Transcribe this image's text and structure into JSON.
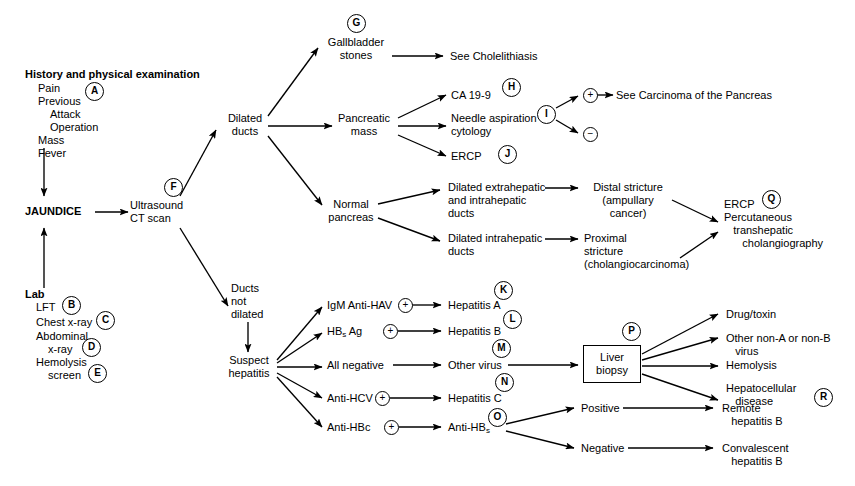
{
  "diagram": {
    "type": "clinical-flowchart",
    "accent_color": "#000000",
    "background_color": "#ffffff"
  },
  "left_column": {
    "history_heading": "History and physical examination",
    "history_items": [
      "Pain",
      "Previous",
      "Attack",
      "Operation",
      "Mass",
      "Fever"
    ],
    "central_node": "JAUNDICE",
    "lab_heading": "Lab",
    "lab_items": [
      "LFT",
      "Chest x-ray",
      "Abdominal",
      "x-ray",
      "Hemolysis",
      "screen"
    ]
  },
  "nodes": {
    "imaging": "Ultrasound\nCT scan",
    "dilated_ducts": "Dilated\nducts",
    "gallbladder_stones": "Gallbladder\nstones",
    "see_cholelithiasis": "See Cholelithiasis",
    "pancreatic_mass": "Pancreatic\nmass",
    "ca_19_9": "CA 19-9",
    "needle_aspiration": "Needle aspiration\ncytology",
    "ercp_small": "ERCP",
    "see_carcinoma": "See Carcinoma of the Pancreas",
    "normal_pancreas": "Normal\npancreas",
    "dilated_extrahepatic": "Dilated extrahepatic\nand intrahepatic\nducts",
    "dilated_intrahepatic": "Dilated intrahepatic\nducts",
    "distal_stricture": "Distal stricture\n(ampullary\ncancer)",
    "proximal_stricture": "Proximal\nstricture\n(cholangiocarcinoma)",
    "ercp_percutaneous": "ERCP\nPercutaneous\n   transhepatic\n      cholangiography",
    "ducts_not_dilated": "Ducts\nnot\ndilated",
    "suspect_hepatitis": "Suspect\nhepatitis",
    "igm_anti_hav": "IgM Anti-HAV",
    "hbs_ag": "HB",
    "hbs_ag_sub": "s",
    "hbs_ag_rest": " Ag",
    "all_negative": "All negative",
    "anti_hcv": "Anti-HCV",
    "anti_hbc": "Anti-HBc",
    "hepatitis_a": "Hepatitis A",
    "hepatitis_b": "Hepatitis B",
    "other_virus": "Other virus",
    "hepatitis_c": "Hepatitis C",
    "anti_hbs": "Anti-HB",
    "anti_hbs_sub": "s",
    "liver_biopsy": "Liver\nbiopsy",
    "drug_toxin": "Drug/toxin",
    "other_non_ab": "Other non-A or non-B\n   virus",
    "hemolysis": "Hemolysis",
    "hepatocellular": "Hepatocellular\n   disease",
    "positive": "Positive",
    "negative": "Negative",
    "remote_hep_b": "Remote\n   hepatitis B",
    "convalescent_hep_b": "Convalescent\n   hepatitis B"
  },
  "markers": {
    "a": "A",
    "b": "B",
    "c": "C",
    "d": "D",
    "e": "E",
    "f": "F",
    "g": "G",
    "h": "H",
    "i": "I",
    "j": "J",
    "k": "K",
    "l": "L",
    "m": "M",
    "n": "N",
    "o": "O",
    "p": "P",
    "q": "Q",
    "r": "R",
    "plus": "+",
    "minus": "−"
  }
}
